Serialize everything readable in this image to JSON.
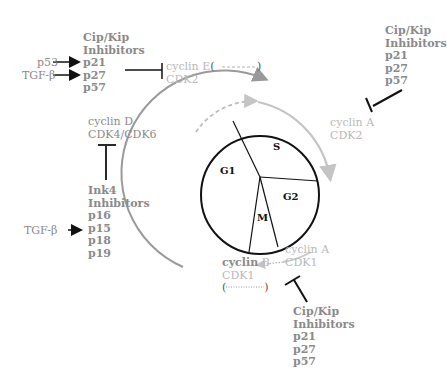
{
  "diagram": {
    "phases": [
      "G1",
      "S",
      "G2",
      "M"
    ],
    "top_left": {
      "inhibitor_title": [
        "Cip/Kip",
        "Inhibitors"
      ],
      "members": [
        "p21",
        "p27",
        "p57"
      ],
      "inputs": [
        "p53",
        "TGF-β"
      ],
      "target": {
        "cyclin": "cyclin E",
        "cyclin_suffix": "(",
        "cyclin_close": ")",
        "cdk": "CDK2"
      }
    },
    "top_right": {
      "inhibitor_title": [
        "Cip/Kip",
        "Inhibitors"
      ],
      "members": [
        "p21",
        "p27",
        "p57"
      ],
      "target": {
        "cyclin": "cyclin A",
        "cdk": "CDK2"
      }
    },
    "left": {
      "target": {
        "cyclin": "cyclin D",
        "cdk": "CDK4/CDK6"
      },
      "inhibitor_title": [
        "Ink4",
        "Inhibitors"
      ],
      "members": [
        "p16",
        "p15",
        "p18",
        "p19"
      ],
      "input": "TGF-β"
    },
    "bottom": {
      "cyclin_b": {
        "word": "cyclin",
        "letter": "B",
        "cdk": "CDK1",
        "paren_open": "(",
        "paren_close": ")"
      },
      "cyclin_a": {
        "cyclin": "cyclin A",
        "cdk": "CDK1"
      },
      "inhibitor_title": [
        "Cip/Kip",
        "Inhibitors"
      ],
      "members": [
        "p21",
        "p27",
        "p57"
      ]
    },
    "colors": {
      "ink": "#111111",
      "gray": "#8a8a8a",
      "light_gray": "#b8b8b8"
    }
  }
}
